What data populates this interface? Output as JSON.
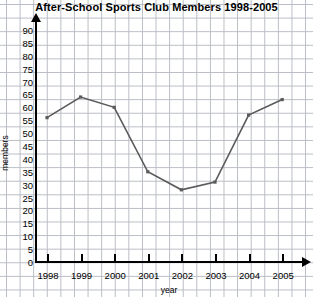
{
  "chart_data": {
    "type": "line",
    "title": "After-School Sports Club Members 1998-2005",
    "xlabel": "year",
    "ylabel": "members",
    "categories": [
      "1998",
      "1999",
      "2000",
      "2001",
      "2002",
      "2003",
      "2004",
      "2005"
    ],
    "values": [
      56,
      64,
      60,
      35,
      28,
      31,
      57,
      63
    ],
    "series": [
      {
        "name": "members",
        "values": [
          56,
          64,
          60,
          35,
          28,
          31,
          57,
          63
        ]
      }
    ],
    "ylim": [
      0,
      90
    ],
    "ytick_step": 5,
    "yticks": [
      0,
      5,
      10,
      15,
      20,
      25,
      30,
      35,
      40,
      45,
      50,
      55,
      60,
      65,
      70,
      75,
      80,
      85,
      90
    ],
    "ytick_labels": [
      "0",
      "5",
      "10",
      "15",
      "20",
      "25",
      "30",
      "35",
      "40",
      "45",
      "50",
      "55",
      "60",
      "65",
      "70",
      "75",
      "80",
      "85",
      "90"
    ],
    "grid": true,
    "grid_style": "graph-paper",
    "legend": null,
    "legend_position": "none",
    "line_color": "#5a5a5a",
    "axis_color": "#000000",
    "grid_color": "#b9bcc4",
    "background_color": "#ffffff",
    "markers": true,
    "x_axis_arrow": true,
    "y_axis_arrow": true
  }
}
